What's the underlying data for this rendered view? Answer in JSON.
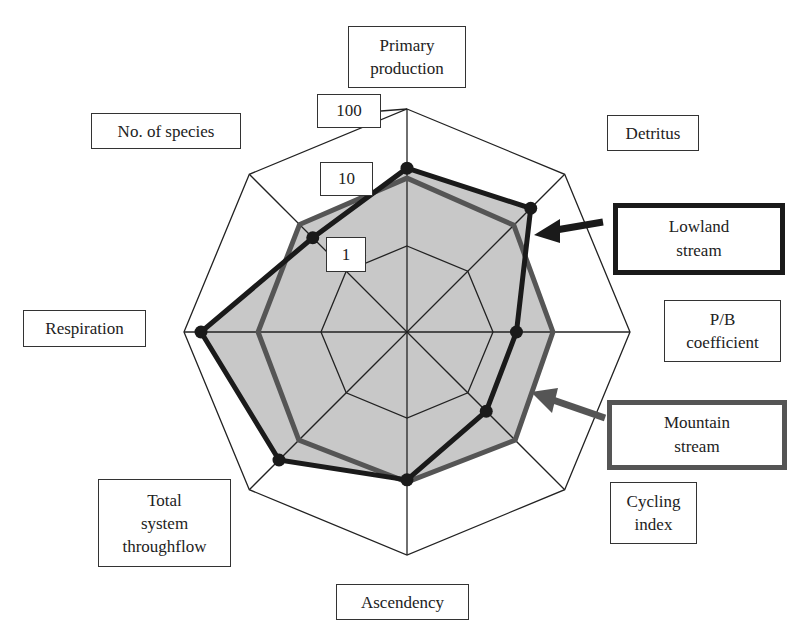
{
  "chart_data": {
    "type": "radar",
    "scale": "log10",
    "tick_labels": [
      "1",
      "10",
      "100"
    ],
    "axes": [
      "Primary production",
      "Detritus",
      "P/B coefficient",
      "Cycling index",
      "Ascendency",
      "Total system throughflow",
      "Respiration",
      "No. of species"
    ],
    "series": [
      {
        "name": "Lowland stream",
        "color": "#1a1a1a",
        "markers": true,
        "values": [
          13.7,
          19.9,
          2.2,
          2.4,
          8.0,
          24.4,
          56.5,
          4.9
        ]
      },
      {
        "name": "Mountain stream",
        "color": "#555555",
        "markers": false,
        "values": [
          9.8,
          8.9,
          7.5,
          9.5,
          8.6,
          9.5,
          8.3,
          9.2
        ]
      }
    ],
    "fill_color": "#c8c8c8",
    "rings": [
      1,
      100
    ]
  },
  "labels": {
    "primary_production": "Primary\nproduction",
    "detritus": "Detritus",
    "pb": "P/B\ncoefficient",
    "cycling": "Cycling\nindex",
    "ascendency": "Ascendency",
    "tst": "Total\nsystem\nthroughflow",
    "respiration": "Respiration",
    "species": "No. of species"
  },
  "ticks": {
    "t1": "1",
    "t10": "10",
    "t100": "100"
  },
  "legend": {
    "lowland": "Lowland\nstream",
    "mountain": "Mountain\nstream"
  }
}
